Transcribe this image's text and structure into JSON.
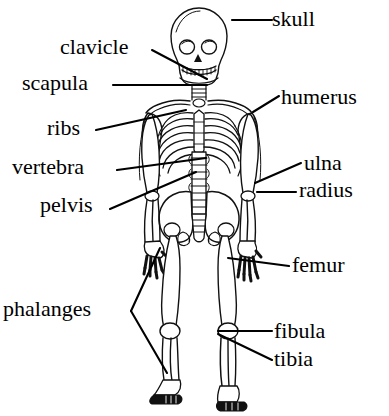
{
  "figure": {
    "background_color": "#ffffff",
    "line_color": "#000000",
    "text_color": "#000000",
    "width": 389,
    "height": 416
  },
  "labels": [
    {
      "id": "skull",
      "text": "skull",
      "x": 272,
      "y": 8,
      "align": "left"
    },
    {
      "id": "clavicle",
      "text": "clavicle",
      "x": 60,
      "y": 36,
      "align": "left"
    },
    {
      "id": "scapula",
      "text": "scapula",
      "x": 22,
      "y": 72,
      "align": "left"
    },
    {
      "id": "humerus",
      "text": "humerus",
      "x": 281,
      "y": 86,
      "align": "left"
    },
    {
      "id": "ribs",
      "text": "ribs",
      "x": 47,
      "y": 117,
      "align": "left"
    },
    {
      "id": "vertebra",
      "text": "vertebra",
      "x": 12,
      "y": 156,
      "align": "left"
    },
    {
      "id": "ulna",
      "text": "ulna",
      "x": 304,
      "y": 152,
      "align": "left"
    },
    {
      "id": "radius",
      "text": "radius",
      "x": 299,
      "y": 179,
      "align": "left"
    },
    {
      "id": "pelvis",
      "text": "pelvis",
      "x": 40,
      "y": 194,
      "align": "left"
    },
    {
      "id": "femur",
      "text": "femur",
      "x": 292,
      "y": 254,
      "align": "left"
    },
    {
      "id": "phalanges",
      "text": "phalanges",
      "x": 3,
      "y": 298,
      "align": "left"
    },
    {
      "id": "fibula",
      "text": "fibula",
      "x": 274,
      "y": 320,
      "align": "left"
    },
    {
      "id": "tibia",
      "text": "tibia",
      "x": 274,
      "y": 348,
      "align": "left"
    }
  ],
  "leader_lines": [
    {
      "id": "skull-leader",
      "points": "232,20 272,20"
    },
    {
      "id": "clavicle-leader",
      "points": "152,50 207,79"
    },
    {
      "id": "scapula-leader",
      "points": "113,85 207,85"
    },
    {
      "id": "ribs-leader",
      "points": "96,130 186,110"
    },
    {
      "id": "humerus-leader",
      "points": "253,112 279,96"
    },
    {
      "id": "vertebra-leader",
      "points": "117,170 206,158"
    },
    {
      "id": "ulna-leader",
      "points": "255,183 301,163"
    },
    {
      "id": "radius-leader",
      "points": "257,192 296,192"
    },
    {
      "id": "pelvis-leader",
      "points": "110,209 196,172"
    },
    {
      "id": "femur-leader",
      "points": "228,258 289,266"
    },
    {
      "id": "fibula-leader",
      "points": "218,331 272,331"
    },
    {
      "id": "tibia-leader",
      "points": "218,334 272,360"
    },
    {
      "id": "phalanges-leader-hand",
      "points": "160,248 131,311"
    },
    {
      "id": "phalanges-leader-foot",
      "points": "131,311 167,373"
    }
  ],
  "anatomy_parts": [
    "skull",
    "clavicle",
    "scapula",
    "humerus",
    "ribs",
    "vertebra",
    "ulna",
    "radius",
    "pelvis",
    "femur",
    "phalanges",
    "fibula",
    "tibia"
  ]
}
